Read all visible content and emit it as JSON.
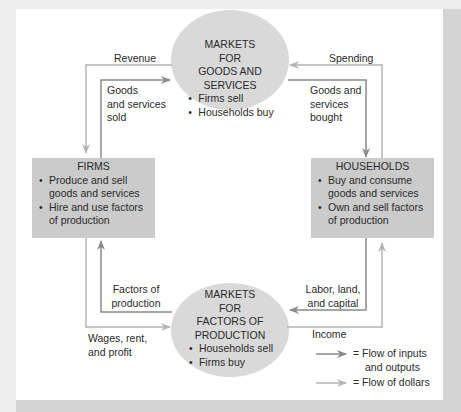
{
  "diagram": {
    "colors": {
      "background": "#ededed",
      "card": "#ffffff",
      "ellipse_fill": "#d9d9d9",
      "box_fill": "#cbcbcb",
      "flow_inputs_outputs": "#8a8a8a",
      "flow_dollars": "#b5b5b5",
      "text": "#2a2a2a"
    },
    "goods_market": {
      "line1": "MARKETS",
      "line2": "FOR",
      "line3": "GOODS AND SERVICES",
      "bullets": [
        "Firms sell",
        "Households buy"
      ]
    },
    "factor_market": {
      "line1": "MARKETS",
      "line2": "FOR",
      "line3": "FACTORS OF PRODUCTION",
      "bullets": [
        "Households sell",
        "Firms buy"
      ]
    },
    "firms": {
      "title": "FIRMS",
      "bullets": [
        [
          "Produce and sell",
          "goods and services"
        ],
        [
          "Hire and use factors",
          "of production"
        ]
      ]
    },
    "households": {
      "title": "HOUSEHOLDS",
      "bullets": [
        [
          "Buy and consume",
          "goods and services"
        ],
        [
          "Own and sell factors",
          "of production"
        ]
      ]
    },
    "flow_labels": {
      "revenue": "Revenue",
      "goods_sold": [
        "Goods",
        "and services",
        "sold"
      ],
      "spending": "Spending",
      "goods_bought": [
        "Goods and",
        "services",
        "bought"
      ],
      "factors_of_production": [
        "Factors of",
        "production"
      ],
      "wages": [
        "Wages, rent,",
        "and profit"
      ],
      "labor": [
        "Labor, land,",
        "and capital"
      ],
      "income": "Income"
    },
    "legend": {
      "items": [
        {
          "label_lines": [
            "= Flow of inputs",
            "and outputs"
          ],
          "color": "#8a8a8a"
        },
        {
          "label_lines": [
            "= Flow of dollars"
          ],
          "color": "#b5b5b5"
        }
      ]
    }
  }
}
